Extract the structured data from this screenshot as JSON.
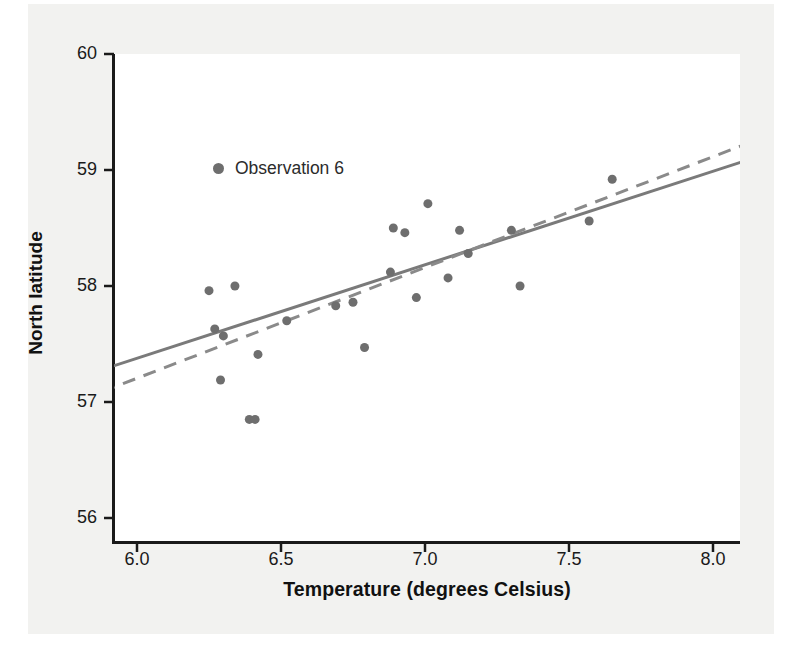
{
  "chart_data": {
    "type": "scatter",
    "title": "",
    "xlabel": "Temperature (degrees Celsius)",
    "ylabel": "North latitude",
    "xlim": [
      5.88,
      8.1
    ],
    "ylim": [
      55.72,
      60.22
    ],
    "xticks": [
      "6.0",
      "6.5",
      "7.0",
      "7.5",
      "8.0"
    ],
    "xtick_values": [
      6.0,
      6.5,
      7.0,
      7.5,
      8.0
    ],
    "yticks": [
      "60",
      "59",
      "58",
      "57",
      "56"
    ],
    "ytick_values": [
      60,
      59,
      58,
      57,
      56
    ],
    "grid": false,
    "legend": {
      "position": "upper-left-inside",
      "entries": [
        {
          "label": "Observation 6",
          "marker": "circle",
          "color": "#6e6e6e"
        }
      ]
    },
    "marker_color": "#6e6e6e",
    "marker_size": 9,
    "points": [
      {
        "x": 6.25,
        "y": 57.96
      },
      {
        "x": 6.27,
        "y": 57.63
      },
      {
        "x": 6.29,
        "y": 57.19
      },
      {
        "x": 6.3,
        "y": 57.57
      },
      {
        "x": 6.34,
        "y": 58.0
      },
      {
        "x": 6.39,
        "y": 56.85
      },
      {
        "x": 6.41,
        "y": 56.85
      },
      {
        "x": 6.42,
        "y": 57.41
      },
      {
        "x": 6.52,
        "y": 57.7
      },
      {
        "x": 6.69,
        "y": 57.83
      },
      {
        "x": 6.75,
        "y": 57.86
      },
      {
        "x": 6.79,
        "y": 57.47
      },
      {
        "x": 6.88,
        "y": 58.12
      },
      {
        "x": 6.89,
        "y": 58.5
      },
      {
        "x": 6.93,
        "y": 58.46
      },
      {
        "x": 6.97,
        "y": 57.9
      },
      {
        "x": 7.01,
        "y": 58.71
      },
      {
        "x": 7.08,
        "y": 58.07
      },
      {
        "x": 7.12,
        "y": 58.48
      },
      {
        "x": 7.15,
        "y": 58.28
      },
      {
        "x": 7.3,
        "y": 58.48
      },
      {
        "x": 7.33,
        "y": 58.0
      },
      {
        "x": 7.57,
        "y": 58.56
      },
      {
        "x": 7.65,
        "y": 58.92
      }
    ],
    "lines": [
      {
        "name": "solid-fit-line",
        "style": "solid",
        "color": "#7a7a7a",
        "width": 3,
        "x_start": 5.88,
        "y_start": 57.28,
        "x_end": 8.1,
        "y_end": 59.07
      },
      {
        "name": "dashed-fit-line",
        "style": "dashed",
        "color": "#8a8a8a",
        "width": 3,
        "x_start": 5.88,
        "y_start": 57.09,
        "x_end": 8.1,
        "y_end": 59.21
      }
    ]
  },
  "colors": {
    "panel_background": "#f2f2f0",
    "plot_background": "#ffffff",
    "axis": "#1a1a1a",
    "marker": "#6e6e6e",
    "solid_line": "#7a7a7a",
    "dashed_line": "#8a8a8a"
  }
}
